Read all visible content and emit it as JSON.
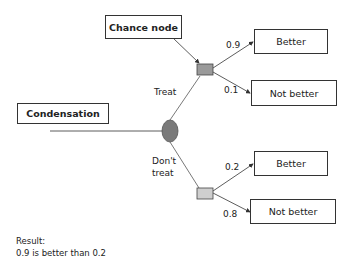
{
  "diagram": {
    "title_box": "Condensation",
    "callout": "Chance node",
    "decision_node": {
      "shape": "ellipse",
      "color": "#7a7a7a"
    },
    "branches": [
      {
        "label": "Treat",
        "chance_node_color": "#9a9a9a",
        "outcomes": [
          {
            "probability": "0.9",
            "label": "Better"
          },
          {
            "probability": "0.1",
            "label": "Not better"
          }
        ]
      },
      {
        "label_line1": "Don't",
        "label_line2": "treat",
        "chance_node_color": "#cfcfcf",
        "outcomes": [
          {
            "probability": "0.2",
            "label": "Better"
          },
          {
            "probability": "0.8",
            "label": "Not better"
          }
        ]
      }
    ],
    "result": {
      "heading": "Result:",
      "text": "0.9 is better than 0.2"
    }
  }
}
